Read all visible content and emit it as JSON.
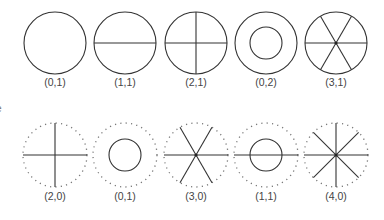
{
  "figure": {
    "line_color": "#333333",
    "dotted_color": "#777777",
    "edge_fragment": "e",
    "top_row": [
      {
        "label": "(0,1)",
        "cx": 55,
        "cy": 43,
        "r": 31,
        "boundary": "solid",
        "inner_r": 0,
        "diameters": 0
      },
      {
        "label": "(1,1)",
        "cx": 125,
        "cy": 43,
        "r": 31,
        "boundary": "solid",
        "inner_r": 0,
        "diameters": 1
      },
      {
        "label": "(2,1)",
        "cx": 196,
        "cy": 43,
        "r": 31,
        "boundary": "solid",
        "inner_r": 0,
        "diameters": 2
      },
      {
        "label": "(0,2)",
        "cx": 266,
        "cy": 43,
        "r": 31,
        "boundary": "solid",
        "inner_r": 16,
        "diameters": 0
      },
      {
        "label": "(3,1)",
        "cx": 336,
        "cy": 43,
        "r": 31,
        "boundary": "solid",
        "inner_r": 0,
        "diameters": 3
      }
    ],
    "bottom_row": [
      {
        "label": "(2,0)",
        "cx": 55,
        "cy": 155,
        "r": 32,
        "boundary": "dotted",
        "inner_r": 0,
        "diameters": 2
      },
      {
        "label": "(0,1)",
        "cx": 125,
        "cy": 155,
        "r": 32,
        "boundary": "dotted",
        "inner_r": 16,
        "diameters": 0
      },
      {
        "label": "(3,0)",
        "cx": 196,
        "cy": 155,
        "r": 32,
        "boundary": "dotted",
        "inner_r": 0,
        "diameters": 3
      },
      {
        "label": "(1,1)",
        "cx": 266,
        "cy": 155,
        "r": 32,
        "boundary": "dotted",
        "inner_r": 16,
        "diameters": 1
      },
      {
        "label": "(4,0)",
        "cx": 336,
        "cy": 155,
        "r": 32,
        "boundary": "dotted",
        "inner_r": 0,
        "diameters": 4
      }
    ],
    "top_label_y": 82,
    "bottom_label_y": 196
  }
}
